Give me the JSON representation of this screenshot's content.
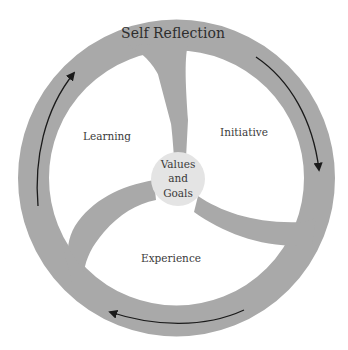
{
  "diagram": {
    "type": "cycle",
    "outer_ring": {
      "label": "Self Reflection",
      "color": "#a9a9a9"
    },
    "center": {
      "line1": "Values",
      "line2": "and",
      "line3": "Goals",
      "color": "#e4e4e4"
    },
    "segments": [
      {
        "label": "Learning"
      },
      {
        "label": "Initiative"
      },
      {
        "label": "Experience"
      }
    ],
    "arrows": {
      "direction": "clockwise",
      "count": 3,
      "color": "#1a1a1a"
    },
    "text_color": "#3a3a3a"
  }
}
